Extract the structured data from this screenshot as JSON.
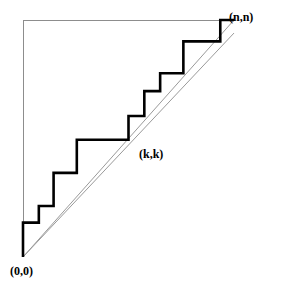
{
  "figure": {
    "background_color": "#ffffff",
    "width": 299,
    "height": 297,
    "labels": {
      "origin": "(0,0)",
      "midpoint": "(k,k)",
      "endpoint": "(n,n)"
    },
    "colors": {
      "staircase": "#000000",
      "diagonal": "#9a9a9a",
      "axis": "#8d8d8d"
    }
  },
  "chart_data": {
    "type": "line",
    "title": "",
    "xlabel": "",
    "ylabel": "",
    "xlim": [
      0,
      10
    ],
    "ylim": [
      0,
      10
    ],
    "grid": false,
    "legend": null,
    "annotations": [
      {
        "text": "(0,0)",
        "x": 0,
        "y": 0,
        "position": "below-left"
      },
      {
        "text": "(k,k)",
        "x": 5,
        "y": 5,
        "position": "below-right"
      },
      {
        "text": "(n,n)",
        "x": 10,
        "y": 10,
        "position": "above-right"
      }
    ],
    "series": [
      {
        "name": "staircase",
        "type": "step",
        "style": "thick-solid",
        "color": "#000000",
        "points": [
          [
            0.0,
            0.0
          ],
          [
            0.0,
            1.45
          ],
          [
            0.75,
            1.45
          ],
          [
            0.75,
            2.15
          ],
          [
            1.45,
            2.15
          ],
          [
            1.45,
            3.55
          ],
          [
            2.55,
            3.55
          ],
          [
            2.55,
            4.95
          ],
          [
            5.0,
            4.95
          ],
          [
            5.0,
            5.95
          ],
          [
            5.75,
            5.95
          ],
          [
            5.75,
            7.0
          ],
          [
            6.5,
            7.0
          ],
          [
            6.5,
            7.75
          ],
          [
            7.6,
            7.75
          ],
          [
            7.6,
            9.1
          ],
          [
            9.35,
            9.1
          ],
          [
            9.35,
            10.0
          ],
          [
            10.0,
            10.0
          ]
        ]
      },
      {
        "name": "diagonal-upper",
        "type": "line",
        "style": "thin-solid",
        "color": "#9a9a9a",
        "points": [
          [
            0.0,
            0.0
          ],
          [
            10.0,
            10.0
          ]
        ]
      },
      {
        "name": "diagonal-lower",
        "type": "line",
        "style": "thin-solid",
        "color": "#9a9a9a",
        "points": [
          [
            0.0,
            0.0
          ],
          [
            10.0,
            9.45
          ]
        ]
      },
      {
        "name": "axis-left",
        "type": "line",
        "style": "thin-solid",
        "color": "#8d8d8d",
        "points": [
          [
            0.0,
            1.45
          ],
          [
            0.0,
            10.0
          ]
        ]
      },
      {
        "name": "axis-top",
        "type": "line",
        "style": "thin-solid",
        "color": "#8d8d8d",
        "points": [
          [
            0.0,
            10.0
          ],
          [
            9.35,
            10.0
          ]
        ]
      }
    ]
  }
}
